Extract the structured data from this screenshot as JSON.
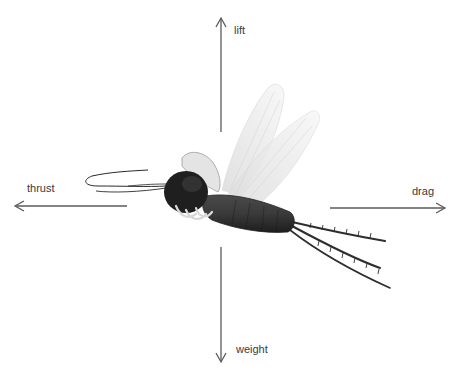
{
  "diagram": {
    "forces": [
      {
        "id": "lift",
        "label": "lift",
        "direction": "up"
      },
      {
        "id": "thrust",
        "label": "thrust",
        "direction": "left"
      },
      {
        "id": "drag",
        "label": "drag",
        "direction": "right"
      },
      {
        "id": "weight",
        "label": "weight",
        "direction": "down"
      }
    ],
    "colors": {
      "background": "#ffffff",
      "arrow": "#5a5a5a",
      "label": "#3a3a3a",
      "body": "#2b2b2b",
      "wing": "#e9e9e9"
    }
  }
}
